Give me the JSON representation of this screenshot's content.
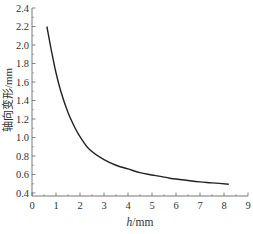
{
  "chart_data": {
    "type": "line",
    "title": "",
    "xlabel": "h/mm",
    "xlabel_italic_part": "h",
    "xlabel_unit": "/mm",
    "ylabel": "轴向变形/mm",
    "xlim": [
      0,
      9
    ],
    "ylim": [
      0.4,
      2.4
    ],
    "x_ticks": [
      0,
      1,
      2,
      3,
      4,
      5,
      6,
      7,
      8,
      9
    ],
    "x_tick_labels": [
      "0",
      "1",
      "2",
      "3",
      "4",
      "5",
      "6",
      "7",
      "8",
      "9"
    ],
    "y_ticks": [
      0.4,
      0.6,
      0.8,
      1.0,
      1.2,
      1.4,
      1.6,
      1.8,
      2.0,
      2.2,
      2.4
    ],
    "y_tick_labels": [
      "0.4",
      "0.6",
      "0.8",
      "1.0",
      "1.2",
      "1.4",
      "1.6",
      "1.8",
      "2.0",
      "2.2",
      "2.4"
    ],
    "grid": false,
    "legend": null,
    "series": [
      {
        "name": "轴向变形",
        "color": "#222222",
        "x": [
          0.62,
          0.8,
          1.0,
          1.2,
          1.5,
          1.8,
          2.0,
          2.4,
          3.0,
          3.5,
          4.0,
          4.5,
          5.0,
          5.75,
          6.5,
          7.0,
          7.5,
          8.2
        ],
        "y": [
          2.2,
          1.95,
          1.7,
          1.5,
          1.27,
          1.1,
          1.01,
          0.87,
          0.76,
          0.7,
          0.66,
          0.62,
          0.595,
          0.56,
          0.535,
          0.52,
          0.51,
          0.495
        ]
      }
    ]
  }
}
